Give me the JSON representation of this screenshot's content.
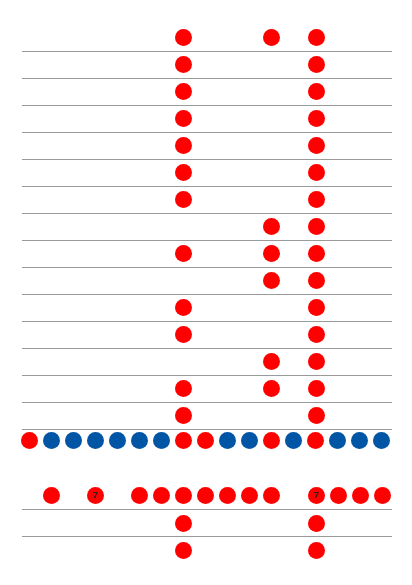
{
  "colors": {
    "red": "#ff0000",
    "blue": "#0055a4",
    "line": "#9a9a9a",
    "background": "#ffffff"
  },
  "columns": {
    "A": 183,
    "B": 271,
    "C": 316
  },
  "lines_y": [
    51,
    78,
    105,
    132,
    159,
    186,
    213,
    240,
    267,
    294,
    321,
    348,
    375,
    402,
    429,
    509,
    536
  ],
  "grid_rows": [
    {
      "y": 37,
      "dots": [
        "A",
        "B",
        "C"
      ]
    },
    {
      "y": 64,
      "dots": [
        "A",
        "C"
      ]
    },
    {
      "y": 91,
      "dots": [
        "A",
        "C"
      ]
    },
    {
      "y": 118,
      "dots": [
        "A",
        "C"
      ]
    },
    {
      "y": 145,
      "dots": [
        "A",
        "C"
      ]
    },
    {
      "y": 172,
      "dots": [
        "A",
        "C"
      ]
    },
    {
      "y": 199,
      "dots": [
        "A",
        "C"
      ]
    },
    {
      "y": 226,
      "dots": [
        "B",
        "C"
      ]
    },
    {
      "y": 253,
      "dots": [
        "A",
        "B",
        "C"
      ]
    },
    {
      "y": 280,
      "dots": [
        "B",
        "C"
      ]
    },
    {
      "y": 307,
      "dots": [
        "A",
        "C"
      ]
    },
    {
      "y": 334,
      "dots": [
        "A",
        "C"
      ]
    },
    {
      "y": 361,
      "dots": [
        "B",
        "C"
      ]
    },
    {
      "y": 388,
      "dots": [
        "A",
        "B",
        "C"
      ]
    },
    {
      "y": 415,
      "dots": [
        "A",
        "C"
      ]
    }
  ],
  "separator_row": {
    "y": 440,
    "x_start": 29,
    "spacing": 22,
    "pattern": [
      "red",
      "blue",
      "blue",
      "blue",
      "blue",
      "blue",
      "blue",
      "red",
      "red",
      "blue",
      "blue",
      "red",
      "blue",
      "red",
      "blue",
      "blue",
      "blue"
    ]
  },
  "bottom_row": {
    "y": 495,
    "dots": [
      {
        "x": 51,
        "label": ""
      },
      {
        "x": 95,
        "label": "7"
      },
      {
        "x": 139,
        "label": ""
      },
      {
        "x": 161,
        "label": ""
      },
      {
        "x": 183,
        "label": ""
      },
      {
        "x": 205,
        "label": ""
      },
      {
        "x": 227,
        "label": ""
      },
      {
        "x": 249,
        "label": ""
      },
      {
        "x": 271,
        "label": ""
      },
      {
        "x": 316,
        "label": "7"
      },
      {
        "x": 338,
        "label": ""
      },
      {
        "x": 360,
        "label": ""
      },
      {
        "x": 382,
        "label": ""
      }
    ]
  },
  "tail_rows": [
    {
      "y": 523,
      "dots": [
        "A",
        "C"
      ]
    },
    {
      "y": 550,
      "dots": [
        "A",
        "C"
      ]
    }
  ]
}
